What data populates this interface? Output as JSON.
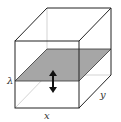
{
  "diagram": {
    "type": "3d-box-with-plane",
    "labels": {
      "lambda": "λ",
      "x": "x",
      "y": "y"
    },
    "colors": {
      "edge": "#222222",
      "hidden_edge": "#c8c8c8",
      "plane_fill": "#a6a6a6",
      "arrow": "#111111",
      "background": "#ffffff"
    }
  }
}
